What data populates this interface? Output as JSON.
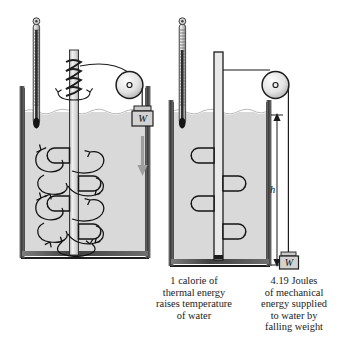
{
  "figure": {
    "colors": {
      "water": "#d9d9d9",
      "wall": "#5a5a5a",
      "outline": "#1a1a1a",
      "arrow_gray": "#9a9a9a",
      "weight_fill": "#d2d2d2",
      "pulley_fill": "#e2e2e2",
      "background": "#ffffff"
    }
  },
  "left_panel": {
    "name": "thermal-energy-panel",
    "thermometer_label": "thermometer",
    "weight_label": "W",
    "fall_arrow_label": "falling-weight-direction",
    "caption": "1 calorie of\nthermal energy\nraises temperature\nof water"
  },
  "right_panel": {
    "name": "mechanical-energy-panel",
    "thermometer_label": "thermometer",
    "weight_label": "W",
    "height_label": "h",
    "caption": "4.19 Joules\nof mechanical\nenergy supplied\nto water by\nfalling weight"
  },
  "annotations": {
    "equivalence": "1 calorie = 4.19 Joules"
  }
}
